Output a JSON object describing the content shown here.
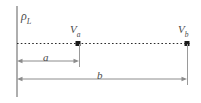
{
  "figure": {
    "title": "",
    "type": "physics-diagram",
    "width": 201,
    "height": 103,
    "background_color": "#ffffff"
  },
  "labels": {
    "line_charge": {
      "symbol": "ρ",
      "subscript": "L",
      "full_text": "ρL"
    },
    "point_a": {
      "symbol": "V",
      "subscript": "a",
      "full_text": "Va"
    },
    "point_b": {
      "symbol": "V",
      "subscript": "b",
      "full_text": "Vb"
    },
    "distance_a": {
      "symbol": "a",
      "subscript": "",
      "full_text": "a"
    },
    "distance_b": {
      "symbol": "b",
      "subscript": "",
      "full_text": "b"
    }
  },
  "colors": {
    "line": "#8c8c8c",
    "dotted_line": "#2b2b2b",
    "point_marker": "#1a1a1a",
    "text": "#4a4a4a",
    "vertical_axis": "#9a9a9a"
  },
  "geometry": {
    "vertical_line": {
      "x": 17,
      "y1": 6,
      "y2": 97
    },
    "dotted_ray": {
      "y": 43,
      "x1": 17,
      "x2": 190
    },
    "marker_a": {
      "x": 78,
      "y": 43
    },
    "marker_b": {
      "x": 187,
      "y": 43
    },
    "dimension_a": {
      "y": 61,
      "x1": 17,
      "x2": 79
    },
    "dimension_b": {
      "y": 79,
      "x1": 17,
      "x2": 187
    },
    "tick_a": {
      "x": 79,
      "y1": 43,
      "y2": 66
    },
    "tick_b": {
      "x": 187,
      "y1": 43,
      "y2": 84
    }
  }
}
